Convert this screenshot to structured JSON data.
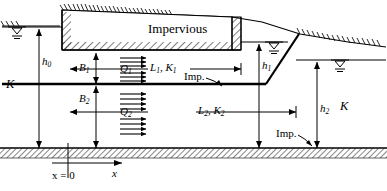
{
  "figure": {
    "type": "seepage-cross-section-diagram",
    "title_text": "Impervious",
    "labels": {
      "impervious_block": "Impervious",
      "imp_upper": "Imp.",
      "imp_lower": "Imp.",
      "k_left": "K",
      "k_right": "K",
      "h0": "h",
      "h0_sub": "0",
      "h1": "h",
      "h1_sub": "1",
      "h2": "h",
      "h2_sub": "2",
      "b1": "B",
      "b1_sub": "1",
      "b2": "B",
      "b2_sub": "2",
      "q1": "Q",
      "q1_sub": "1",
      "q2": "Q",
      "q2_sub": "2",
      "l1k1_l": "L",
      "l1k1_l_sub": "1",
      "l1k1_sep": ", ",
      "l1k1_k": "K",
      "l1k1_k_sub": "1",
      "l2k2_l": "L",
      "l2k2_l_sub": "2",
      "l2k2_sep": ", ",
      "l2k2_k": "K",
      "l2k2_k_sub": "2",
      "origin": "x = 0",
      "x_axis": "x"
    },
    "colors": {
      "line": "#000000",
      "background": "#ffffff",
      "hatch": "#1a1a1a",
      "arrow": "#000000"
    },
    "icons": {
      "water_table_left": "water-table-symbol",
      "water_table_mid": "water-table-symbol",
      "water_table_right": "water-table-symbol",
      "flow_arrows_upper": "flow-arrow-group",
      "flow_arrows_lower": "flow-arrow-group",
      "ground_surface": "ground-hatch"
    }
  }
}
